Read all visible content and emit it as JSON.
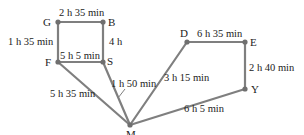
{
  "diagram": {
    "type": "weighted-graph",
    "colors": {
      "edge": "#7f7f7f",
      "node": "#6f6f6f",
      "text": "#222222"
    },
    "nodes": [
      {
        "id": "G",
        "label": "G",
        "x": 58,
        "y": 22
      },
      {
        "id": "B",
        "label": "B",
        "x": 103,
        "y": 22
      },
      {
        "id": "F",
        "label": "F",
        "x": 58,
        "y": 62
      },
      {
        "id": "S",
        "label": "S",
        "x": 103,
        "y": 62
      },
      {
        "id": "M",
        "label": "M",
        "x": 130,
        "y": 125
      },
      {
        "id": "D",
        "label": "D",
        "x": 187,
        "y": 42
      },
      {
        "id": "E",
        "label": "E",
        "x": 245,
        "y": 42
      },
      {
        "id": "Y",
        "label": "Y",
        "x": 245,
        "y": 89
      }
    ],
    "edges": [
      {
        "from": "G",
        "to": "B",
        "label": "2 h 35 min"
      },
      {
        "from": "G",
        "to": "F",
        "label": "1 h 35 min"
      },
      {
        "from": "B",
        "to": "S",
        "label": "4 h"
      },
      {
        "from": "F",
        "to": "S",
        "label": "5 h 5 min"
      },
      {
        "from": "S",
        "to": "M",
        "label": "1 h 50 min"
      },
      {
        "from": "F",
        "to": "M",
        "label": "5 h 35 min"
      },
      {
        "from": "M",
        "to": "D",
        "label": "3 h 15 min"
      },
      {
        "from": "D",
        "to": "E",
        "label": "6 h 35 min"
      },
      {
        "from": "E",
        "to": "Y",
        "label": "2 h 40 min"
      },
      {
        "from": "M",
        "to": "Y",
        "label": "6 h 5 min"
      }
    ]
  }
}
